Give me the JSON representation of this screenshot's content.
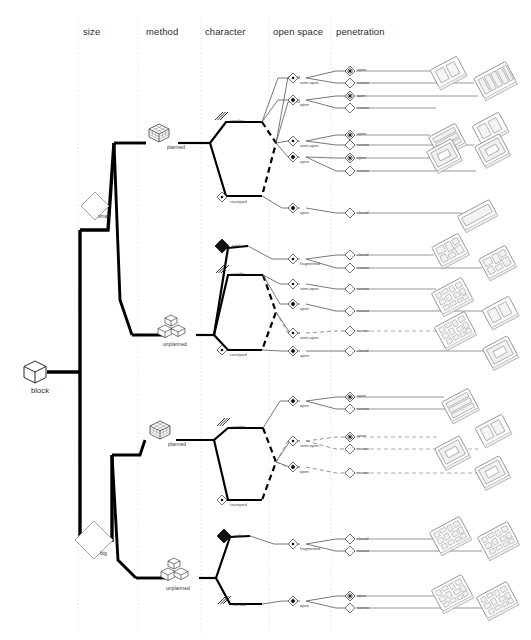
{
  "figure": {
    "type": "hierarchical-taxonomy-dendrogram",
    "root_label": "block",
    "root_icon": "cube-icon",
    "background": "#ffffff",
    "line_color": "#000000",
    "column_separator_color": "#d8d8d8"
  },
  "columns": [
    {
      "id": "size",
      "label": "size",
      "x": 83
    },
    {
      "id": "method",
      "label": "method",
      "x": 146
    },
    {
      "id": "character",
      "label": "character",
      "x": 205
    },
    {
      "id": "open_space",
      "label": "open space",
      "x": 273
    },
    {
      "id": "penetration",
      "label": "penetration",
      "x": 336
    }
  ],
  "icons": {
    "cube": "cube-icon",
    "diamond_outline": "diamond-outline-icon",
    "diamond_filled": "diamond-filled-icon",
    "diamond_dot": "diamond-dot-icon",
    "diamond_dot_small": "diamond-small-dot-icon",
    "diamond_star": "diamond-star-icon",
    "grid_cube": "grid-cube-icon",
    "stacked_cubes": "stacked-cubes-icon",
    "hatch_lines": "hatched-lines-icon",
    "building_block": "isometric-building-block-icon"
  },
  "size_nodes": [
    {
      "id": "small",
      "label": "small",
      "icon": "diamond-outline-icon",
      "x": 95,
      "y": 205
    },
    {
      "id": "big",
      "label": "big",
      "icon": "diamond-outline-icon",
      "x": 95,
      "y": 540
    }
  ],
  "method_nodes": [
    {
      "id": "planned_small",
      "label": "planned",
      "icon": "grid-cube-icon",
      "x": 158,
      "y": 140
    },
    {
      "id": "unplanned_small",
      "label": "unplanned",
      "icon": "stacked-cubes-icon",
      "x": 158,
      "y": 330
    },
    {
      "id": "planned_big",
      "label": "planned",
      "icon": "grid-cube-icon",
      "x": 158,
      "y": 432
    },
    {
      "id": "unplanned_big",
      "label": "unplanned",
      "icon": "stacked-cubes-icon",
      "x": 158,
      "y": 580
    }
  ],
  "character_nodes": [
    {
      "id": "c1",
      "label": "corridor",
      "icon": "hatched-lines-icon",
      "x": 222,
      "y": 120
    },
    {
      "id": "c2",
      "label": "courtyard",
      "icon": "diamond-dot-icon",
      "x": 222,
      "y": 197
    },
    {
      "id": "c3",
      "label": "solid",
      "icon": "diamond-filled-icon",
      "x": 222,
      "y": 245
    },
    {
      "id": "c4",
      "label": "corridor",
      "icon": "hatched-lines-icon",
      "x": 222,
      "y": 272
    },
    {
      "id": "c5",
      "label": "courtyard",
      "icon": "diamond-dot-icon",
      "x": 222,
      "y": 348
    },
    {
      "id": "c6",
      "label": "corridor",
      "icon": "hatched-lines-icon",
      "x": 222,
      "y": 425
    },
    {
      "id": "c7",
      "label": "courtyard",
      "icon": "diamond-dot-icon",
      "x": 222,
      "y": 500
    },
    {
      "id": "c8",
      "label": "solid",
      "icon": "diamond-filled-icon",
      "x": 222,
      "y": 534
    },
    {
      "id": "c9",
      "label": "corridor",
      "icon": "hatched-lines-icon",
      "x": 222,
      "y": 603
    }
  ],
  "open_space_nodes": [
    {
      "id": "o1",
      "label": "semi-open",
      "icon": "diamond-dot-icon",
      "x": 290,
      "y": 75
    },
    {
      "id": "o2",
      "label": "open",
      "icon": "diamond-filled-icon",
      "x": 290,
      "y": 100
    },
    {
      "id": "o3",
      "label": "semi-open",
      "icon": "diamond-dot-icon",
      "x": 290,
      "y": 140
    },
    {
      "id": "o4",
      "label": "open",
      "icon": "diamond-filled-icon",
      "x": 290,
      "y": 155
    },
    {
      "id": "o5",
      "label": "open",
      "icon": "diamond-filled-icon",
      "x": 290,
      "y": 207
    },
    {
      "id": "o6",
      "label": "fragmented",
      "icon": "diamond-dot-icon",
      "x": 290,
      "y": 258
    },
    {
      "id": "o7",
      "label": "semi-open",
      "icon": "diamond-dot-icon",
      "x": 290,
      "y": 283
    },
    {
      "id": "o8",
      "label": "open",
      "icon": "diamond-filled-icon",
      "x": 290,
      "y": 303
    },
    {
      "id": "o9",
      "label": "semi-open",
      "icon": "diamond-dot-icon",
      "x": 290,
      "y": 332
    },
    {
      "id": "o10",
      "label": "open",
      "icon": "diamond-filled-icon",
      "x": 290,
      "y": 350
    },
    {
      "id": "o11",
      "label": "open",
      "icon": "diamond-filled-icon",
      "x": 290,
      "y": 400
    },
    {
      "id": "o12",
      "label": "semi-open",
      "icon": "diamond-dot-icon",
      "x": 290,
      "y": 440
    },
    {
      "id": "o13",
      "label": "open",
      "icon": "diamond-filled-icon",
      "x": 290,
      "y": 466
    },
    {
      "id": "o14",
      "label": "fragmented",
      "icon": "diamond-dot-icon",
      "x": 290,
      "y": 543
    },
    {
      "id": "o15",
      "label": "open",
      "icon": "diamond-filled-icon",
      "x": 290,
      "y": 600
    }
  ],
  "penetration_nodes": [
    {
      "id": "p1",
      "label": "open",
      "icon": "diamond-star-icon",
      "x": 350,
      "y": 70
    },
    {
      "id": "p2",
      "label": "narrow",
      "icon": "diamond-outline-icon",
      "x": 350,
      "y": 82
    },
    {
      "id": "p3",
      "label": "open",
      "icon": "diamond-star-icon",
      "x": 350,
      "y": 95
    },
    {
      "id": "p4",
      "label": "narrow",
      "icon": "diamond-outline-icon",
      "x": 350,
      "y": 107
    },
    {
      "id": "p5",
      "label": "open",
      "icon": "diamond-star-icon",
      "x": 350,
      "y": 134
    },
    {
      "id": "p6",
      "label": "narrow",
      "icon": "diamond-outline-icon",
      "x": 350,
      "y": 144
    },
    {
      "id": "p7",
      "label": "open",
      "icon": "diamond-star-icon",
      "x": 350,
      "y": 157
    },
    {
      "id": "p8",
      "label": "narrow",
      "icon": "diamond-outline-icon",
      "x": 350,
      "y": 170
    },
    {
      "id": "p9",
      "label": "closed",
      "icon": "diamond-outline-icon",
      "x": 350,
      "y": 212
    },
    {
      "id": "p10",
      "label": "closed",
      "icon": "diamond-outline-icon",
      "x": 350,
      "y": 254
    },
    {
      "id": "p11",
      "label": "narrow",
      "icon": "diamond-outline-icon",
      "x": 350,
      "y": 267
    },
    {
      "id": "p12",
      "label": "narrow",
      "icon": "diamond-outline-icon",
      "x": 350,
      "y": 288
    },
    {
      "id": "p13",
      "label": "narrow",
      "icon": "diamond-outline-icon",
      "x": 350,
      "y": 310
    },
    {
      "id": "p14",
      "label": "narrow",
      "icon": "diamond-outline-icon",
      "x": 350,
      "y": 330
    },
    {
      "id": "p15",
      "label": "closed",
      "icon": "diamond-outline-icon",
      "x": 350,
      "y": 350
    },
    {
      "id": "p16",
      "label": "open",
      "icon": "diamond-star-icon",
      "x": 350,
      "y": 396
    },
    {
      "id": "p17",
      "label": "narrow",
      "icon": "diamond-outline-icon",
      "x": 350,
      "y": 408
    },
    {
      "id": "p18",
      "label": "open",
      "icon": "diamond-star-icon",
      "x": 350,
      "y": 436
    },
    {
      "id": "p19",
      "label": "narrow",
      "icon": "diamond-outline-icon",
      "x": 350,
      "y": 448
    },
    {
      "id": "p20",
      "label": "narrow",
      "icon": "diamond-outline-icon",
      "x": 350,
      "y": 472
    },
    {
      "id": "p21",
      "label": "closed",
      "icon": "diamond-outline-icon",
      "x": 350,
      "y": 538
    },
    {
      "id": "p22",
      "label": "narrow",
      "icon": "diamond-outline-icon",
      "x": 350,
      "y": 550
    },
    {
      "id": "p23",
      "label": "open",
      "icon": "diamond-star-icon",
      "x": 350,
      "y": 595
    },
    {
      "id": "p24",
      "label": "narrow",
      "icon": "diamond-outline-icon",
      "x": 350,
      "y": 607
    }
  ],
  "result_icons": [
    {
      "id": "r1",
      "x": 448,
      "y": 72,
      "rot": -28,
      "w": 30,
      "h": 20,
      "style": "slab-pair"
    },
    {
      "id": "r2",
      "x": 495,
      "y": 80,
      "rot": -28,
      "w": 36,
      "h": 23,
      "style": "comb"
    },
    {
      "id": "r3",
      "x": 490,
      "y": 128,
      "rot": -28,
      "w": 30,
      "h": 20,
      "style": "slab-pair"
    },
    {
      "id": "r4",
      "x": 447,
      "y": 140,
      "rot": -28,
      "w": 30,
      "h": 22,
      "style": "rows"
    },
    {
      "id": "r5",
      "x": 444,
      "y": 155,
      "rot": -28,
      "w": 28,
      "h": 20,
      "style": "court"
    },
    {
      "id": "r6",
      "x": 492,
      "y": 150,
      "rot": -28,
      "w": 30,
      "h": 22,
      "style": "court"
    },
    {
      "id": "r7",
      "x": 477,
      "y": 215,
      "rot": -28,
      "w": 36,
      "h": 16,
      "style": "bar"
    },
    {
      "id": "r8",
      "x": 450,
      "y": 250,
      "rot": -28,
      "w": 30,
      "h": 22,
      "style": "blocky"
    },
    {
      "id": "r9",
      "x": 497,
      "y": 262,
      "rot": -28,
      "w": 30,
      "h": 22,
      "style": "blocky"
    },
    {
      "id": "r10",
      "x": 452,
      "y": 296,
      "rot": -28,
      "w": 34,
      "h": 26,
      "style": "cluster"
    },
    {
      "id": "r11",
      "x": 500,
      "y": 312,
      "rot": -28,
      "w": 28,
      "h": 22,
      "style": "slab-pair"
    },
    {
      "id": "r12",
      "x": 455,
      "y": 330,
      "rot": -28,
      "w": 30,
      "h": 22,
      "style": "cluster"
    },
    {
      "id": "r13",
      "x": 500,
      "y": 352,
      "rot": -28,
      "w": 26,
      "h": 22,
      "style": "court"
    },
    {
      "id": "r14",
      "x": 460,
      "y": 405,
      "rot": -28,
      "w": 34,
      "h": 22,
      "style": "rows"
    },
    {
      "id": "r15",
      "x": 493,
      "y": 430,
      "rot": -28,
      "w": 30,
      "h": 22,
      "style": "slab-pair"
    },
    {
      "id": "r16",
      "x": 452,
      "y": 452,
      "rot": -28,
      "w": 28,
      "h": 22,
      "style": "court"
    },
    {
      "id": "r17",
      "x": 492,
      "y": 472,
      "rot": -28,
      "w": 26,
      "h": 22,
      "style": "court"
    },
    {
      "id": "r18",
      "x": 450,
      "y": 535,
      "rot": -28,
      "w": 32,
      "h": 24,
      "style": "cluster"
    },
    {
      "id": "r19",
      "x": 498,
      "y": 540,
      "rot": -28,
      "w": 34,
      "h": 26,
      "style": "cluster"
    },
    {
      "id": "r20",
      "x": 452,
      "y": 593,
      "rot": -28,
      "w": 32,
      "h": 24,
      "style": "cluster"
    },
    {
      "id": "r21",
      "x": 497,
      "y": 600,
      "rot": -28,
      "w": 32,
      "h": 24,
      "style": "cluster"
    }
  ]
}
